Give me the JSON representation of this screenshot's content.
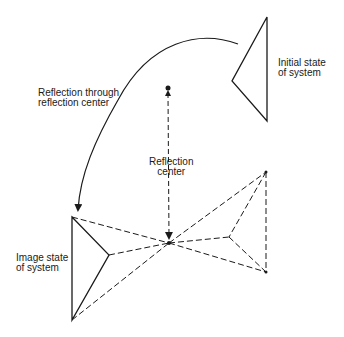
{
  "labels": {
    "initial_state_line1": "Initial state",
    "initial_state_line2": "of system",
    "reflection_through_line1": "Reflection through",
    "reflection_through_line2": "reflection center",
    "reflection_center_line1": "Reflection",
    "reflection_center_line2": "center",
    "image_state_line1": "Image state",
    "image_state_line2": "of system"
  },
  "colors": {
    "stroke": "#1a1a1a",
    "background": "#ffffff"
  },
  "geometry": {
    "initial_triangle": [
      [
        267,
        17
      ],
      [
        232,
        81
      ],
      [
        267,
        121
      ]
    ],
    "image_triangle": [
      [
        72,
        217
      ],
      [
        109,
        255
      ],
      [
        72,
        320
      ]
    ],
    "dashed_projection_triangle": [
      [
        266,
        172
      ],
      [
        229,
        237
      ],
      [
        266,
        272
      ]
    ],
    "reflection_center": [
      169,
      243
    ],
    "dot": [
      168,
      88
    ]
  }
}
